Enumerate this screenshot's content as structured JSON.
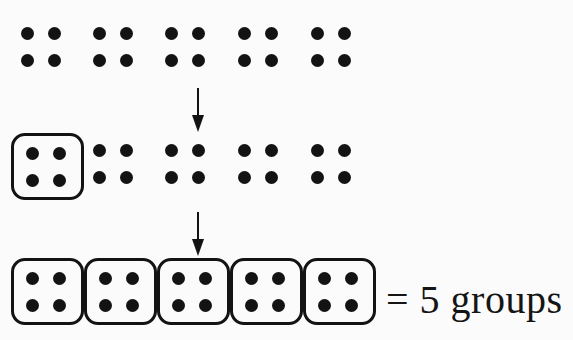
{
  "figure": {
    "background_color": "#fbfbfb",
    "ink_color": "#131313",
    "dots_per_group": 4,
    "dot_layout": "2x2",
    "rows": [
      {
        "name": "ungrouped-row",
        "label": "row-1",
        "groups": [
          {
            "id": "r1-g1",
            "boxed": false,
            "dots": 4
          },
          {
            "id": "r1-g2",
            "boxed": false,
            "dots": 4
          },
          {
            "id": "r1-g3",
            "boxed": false,
            "dots": 4
          },
          {
            "id": "r1-g4",
            "boxed": false,
            "dots": 4
          },
          {
            "id": "r1-g5",
            "boxed": false,
            "dots": 4
          }
        ]
      },
      {
        "name": "partially-grouped-row",
        "label": "row-2",
        "groups": [
          {
            "id": "r2-g1",
            "boxed": true,
            "dots": 4
          },
          {
            "id": "r2-g2",
            "boxed": false,
            "dots": 4
          },
          {
            "id": "r2-g3",
            "boxed": false,
            "dots": 4
          },
          {
            "id": "r2-g4",
            "boxed": false,
            "dots": 4
          },
          {
            "id": "r2-g5",
            "boxed": false,
            "dots": 4
          }
        ]
      },
      {
        "name": "fully-grouped-row",
        "label": "row-3",
        "groups": [
          {
            "id": "r3-g1",
            "boxed": true,
            "dots": 4
          },
          {
            "id": "r3-g2",
            "boxed": true,
            "dots": 4
          },
          {
            "id": "r3-g3",
            "boxed": true,
            "dots": 4
          },
          {
            "id": "r3-g4",
            "boxed": true,
            "dots": 4
          },
          {
            "id": "r3-g5",
            "boxed": true,
            "dots": 4
          }
        ]
      }
    ],
    "arrows": [
      {
        "id": "arrow-1",
        "direction": "down"
      },
      {
        "id": "arrow-2",
        "direction": "down"
      }
    ],
    "result": {
      "equals_sign": "=",
      "count": "5",
      "unit": "groups",
      "full_text": "= 5 groups"
    }
  }
}
